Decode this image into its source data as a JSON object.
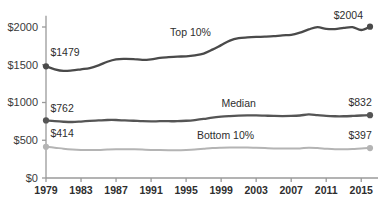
{
  "chart_data": {
    "type": "line",
    "title": "",
    "subtitle": "",
    "xlabel": "",
    "ylabel": "",
    "xlim": [
      1979,
      2016
    ],
    "ylim": [
      0,
      2200
    ],
    "grid": false,
    "legend_position": "inline-annotations",
    "y_ticks": [
      {
        "value": 0,
        "label": "$0"
      },
      {
        "value": 500,
        "label": "$500"
      },
      {
        "value": 1000,
        "label": "$1000"
      },
      {
        "value": 1500,
        "label": "$1500"
      },
      {
        "value": 2000,
        "label": "$2000"
      }
    ],
    "x_ticks": [
      {
        "value": 1979,
        "label": "1979"
      },
      {
        "value": 1983,
        "label": "1983"
      },
      {
        "value": 1987,
        "label": "1987"
      },
      {
        "value": 1991,
        "label": "1991"
      },
      {
        "value": 1995,
        "label": "1995"
      },
      {
        "value": 1999,
        "label": "1999"
      },
      {
        "value": 2003,
        "label": "2003"
      },
      {
        "value": 2007,
        "label": "2007"
      },
      {
        "value": 2011,
        "label": "2011"
      },
      {
        "value": 2015,
        "label": "2015"
      }
    ],
    "x": [
      1979,
      1980,
      1981,
      1982,
      1983,
      1984,
      1985,
      1986,
      1987,
      1988,
      1989,
      1990,
      1991,
      1992,
      1993,
      1994,
      1995,
      1996,
      1997,
      1998,
      1999,
      2000,
      2001,
      2002,
      2003,
      2004,
      2005,
      2006,
      2007,
      2008,
      2009,
      2010,
      2011,
      2012,
      2013,
      2014,
      2015,
      2016
    ],
    "series": [
      {
        "name": "Top 10%",
        "color": "#4a4a4a",
        "label": "Top 10%",
        "start_value_label": "$1479",
        "end_value_label": "$2004",
        "values": [
          1479,
          1440,
          1418,
          1425,
          1440,
          1455,
          1492,
          1540,
          1572,
          1578,
          1575,
          1565,
          1572,
          1590,
          1600,
          1608,
          1612,
          1625,
          1648,
          1700,
          1760,
          1820,
          1852,
          1862,
          1868,
          1872,
          1878,
          1890,
          1895,
          1925,
          1968,
          1998,
          1975,
          1972,
          1988,
          1998,
          1960,
          2004
        ]
      },
      {
        "name": "Median",
        "color": "#555555",
        "label": "Median",
        "start_value_label": "$762",
        "end_value_label": "$832",
        "values": [
          762,
          752,
          745,
          742,
          748,
          756,
          762,
          768,
          768,
          762,
          758,
          752,
          750,
          752,
          752,
          752,
          758,
          768,
          782,
          800,
          812,
          820,
          826,
          830,
          830,
          826,
          822,
          820,
          822,
          828,
          842,
          832,
          822,
          818,
          818,
          822,
          828,
          832
        ]
      },
      {
        "name": "Bottom 10%",
        "color": "#b4b4b4",
        "label": "Bottom 10%",
        "start_value_label": "$414",
        "end_value_label": "$397",
        "values": [
          414,
          402,
          388,
          378,
          372,
          370,
          372,
          378,
          382,
          382,
          380,
          376,
          372,
          370,
          368,
          368,
          372,
          378,
          388,
          398,
          402,
          404,
          404,
          404,
          400,
          396,
          392,
          390,
          390,
          392,
          400,
          396,
          388,
          382,
          380,
          384,
          392,
          397
        ]
      }
    ],
    "annotations": [
      {
        "text": "$1479",
        "x": 1979.5,
        "y": 1620,
        "anchor": "start"
      },
      {
        "text": "$2004",
        "x": 2015.2,
        "y": 2110,
        "anchor": "end"
      },
      {
        "text": "$762",
        "x": 1979.5,
        "y": 880,
        "anchor": "start"
      },
      {
        "text": "$832",
        "x": 2016.2,
        "y": 950,
        "anchor": "end"
      },
      {
        "text": "$414",
        "x": 1979.5,
        "y": 540,
        "anchor": "start"
      },
      {
        "text": "$397",
        "x": 2016.2,
        "y": 520,
        "anchor": "end"
      },
      {
        "text": "Top 10%",
        "x": 1995.5,
        "y": 1880,
        "anchor": "middle"
      },
      {
        "text": "Median",
        "x": 2001.0,
        "y": 940,
        "anchor": "middle"
      },
      {
        "text": "Bottom 10%",
        "x": 1999.5,
        "y": 520,
        "anchor": "middle"
      }
    ],
    "endpoint_markers": [
      {
        "series": "Top 10%",
        "x": 1979,
        "value": 1479
      },
      {
        "series": "Top 10%",
        "x": 2016,
        "value": 2004
      },
      {
        "series": "Median",
        "x": 1979,
        "value": 762
      },
      {
        "series": "Median",
        "x": 2016,
        "value": 832
      },
      {
        "series": "Bottom 10%",
        "x": 1979,
        "value": 414
      },
      {
        "series": "Bottom 10%",
        "x": 2016,
        "value": 397
      }
    ],
    "axis_color": "#9a9a9a"
  }
}
